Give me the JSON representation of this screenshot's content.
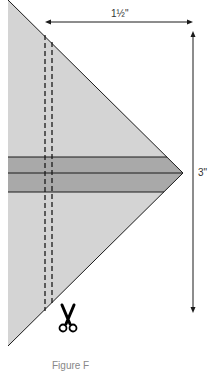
{
  "diagram": {
    "width_label": "1½\"",
    "height_label": "3\"",
    "caption": "Figure F",
    "colors": {
      "triangle_fill": "#d4d4d4",
      "strip_fill": "#a9a9a9",
      "outline": "#1a1a1a",
      "dash": "#1a1a1a"
    },
    "icons": {
      "cut": "scissors-icon"
    }
  }
}
